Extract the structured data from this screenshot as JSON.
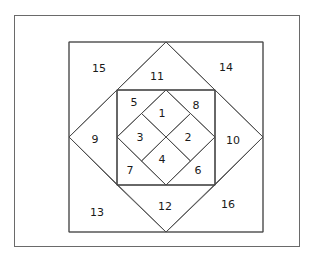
{
  "diagram": {
    "title": "",
    "type": "quilt-block-piecing-diagram",
    "line_color": "#4a4a4a",
    "hatch_color": "#5a5a5a",
    "pieces": [
      {
        "id": "1",
        "label": "1",
        "fill": "plain"
      },
      {
        "id": "2",
        "label": "2",
        "fill": "hatch-diagonal"
      },
      {
        "id": "3",
        "label": "3",
        "fill": "hatch-diagonal"
      },
      {
        "id": "4",
        "label": "4",
        "fill": "plain"
      },
      {
        "id": "5",
        "label": "5",
        "fill": "plain"
      },
      {
        "id": "6",
        "label": "6",
        "fill": "plain"
      },
      {
        "id": "7",
        "label": "7",
        "fill": "hatch-backslash"
      },
      {
        "id": "8",
        "label": "8",
        "fill": "hatch-backslash"
      },
      {
        "id": "9",
        "label": "9",
        "fill": "plain"
      },
      {
        "id": "10",
        "label": "10",
        "fill": "plain"
      },
      {
        "id": "11",
        "label": "11",
        "fill": "hatch-horizontal"
      },
      {
        "id": "12",
        "label": "12",
        "fill": "hatch-horizontal"
      },
      {
        "id": "13",
        "label": "13",
        "fill": "plain"
      },
      {
        "id": "14",
        "label": "14",
        "fill": "plain"
      },
      {
        "id": "15",
        "label": "15",
        "fill": "hatch-diagonal"
      },
      {
        "id": "16",
        "label": "16",
        "fill": "hatch-diagonal"
      }
    ]
  }
}
